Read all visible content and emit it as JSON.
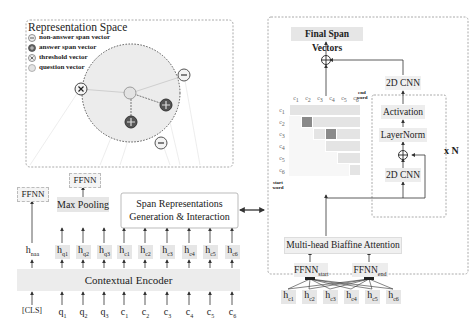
{
  "representation_space": {
    "title": "Representation Space",
    "legend": [
      {
        "icon": "minus-circle-icon",
        "label": "non-answer span vector"
      },
      {
        "icon": "plus-circle-dark-icon",
        "label": "answer span vector"
      },
      {
        "icon": "x-circle-icon",
        "label": "threshold vector"
      },
      {
        "icon": "plain-circle-icon",
        "label": "question vector"
      }
    ]
  },
  "left": {
    "ffnn_left": "FFNN",
    "ffnn_mid": "FFNN",
    "max_pooling": "Max Pooling",
    "span_repr_line1": "Span Representations",
    "span_repr_line2": "Generation & Interaction",
    "encoder": "Contextual Encoder",
    "hidden": [
      {
        "base": "h",
        "sub": "naa"
      },
      {
        "base": "h",
        "sub": "q1"
      },
      {
        "base": "h",
        "sub": "q2"
      },
      {
        "base": "h",
        "sub": "q3"
      },
      {
        "base": "h",
        "sub": "c1"
      },
      {
        "base": "h",
        "sub": "c2"
      },
      {
        "base": "h",
        "sub": "c3"
      },
      {
        "base": "h",
        "sub": "c4"
      },
      {
        "base": "h",
        "sub": "c5"
      },
      {
        "base": "h",
        "sub": "c6"
      }
    ],
    "inputs": [
      {
        "base": "[CLS]",
        "sub": ""
      },
      {
        "base": "q",
        "sub": "1"
      },
      {
        "base": "q",
        "sub": "2"
      },
      {
        "base": "q",
        "sub": "3"
      },
      {
        "base": "c",
        "sub": "1"
      },
      {
        "base": "c",
        "sub": "2"
      },
      {
        "base": "c",
        "sub": "3"
      },
      {
        "base": "c",
        "sub": "4"
      },
      {
        "base": "c",
        "sub": "5"
      },
      {
        "base": "c",
        "sub": "6"
      }
    ]
  },
  "right": {
    "final": "Final Span Vectors",
    "cnn_top": "2D CNN",
    "activation": "Activation",
    "layernorm": "LayerNorm",
    "cnn_inner": "2D CNN",
    "repeat": "x N",
    "biaffine": "Multi-head Biaffine Attention",
    "ffnn_start": {
      "base": "FFNN",
      "sub": "start"
    },
    "ffnn_end": {
      "base": "FFNN",
      "sub": "end"
    },
    "end_word": "end word",
    "start_word": "start word",
    "grid_cols": [
      {
        "base": "c",
        "sub": "1"
      },
      {
        "base": "c",
        "sub": "2"
      },
      {
        "base": "c",
        "sub": "3"
      },
      {
        "base": "c",
        "sub": "4"
      },
      {
        "base": "c",
        "sub": "5"
      },
      {
        "base": "c",
        "sub": "6"
      }
    ],
    "grid_rows": [
      {
        "base": "c",
        "sub": "1"
      },
      {
        "base": "c",
        "sub": "2"
      },
      {
        "base": "c",
        "sub": "3"
      },
      {
        "base": "c",
        "sub": "4"
      },
      {
        "base": "c",
        "sub": "5"
      },
      {
        "base": "c",
        "sub": "6"
      }
    ],
    "hidden": [
      {
        "base": "h",
        "sub": "c1"
      },
      {
        "base": "h",
        "sub": "c2"
      },
      {
        "base": "h",
        "sub": "c3"
      },
      {
        "base": "h",
        "sub": "c4"
      },
      {
        "base": "h",
        "sub": "c5"
      },
      {
        "base": "h",
        "sub": "c6"
      }
    ]
  },
  "colors": {
    "box_fill": "#e6e6e6",
    "dark_cell": "#8a8a8a",
    "border": "#b5b5b5"
  }
}
